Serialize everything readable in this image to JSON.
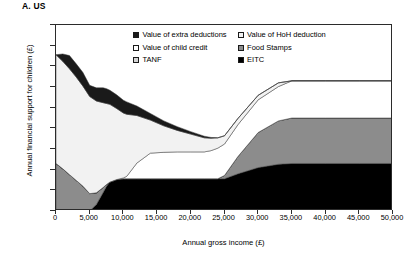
{
  "panel": {
    "title": "A. US"
  },
  "axes": {
    "xlabel": "Annual gross income (£)",
    "ylabel": "Annual financial support for children (£)",
    "yticks": [
      "0",
      "500",
      "1,000",
      "1,500",
      "2,000",
      "2,500",
      "3,000",
      "3,500",
      "4,000",
      "4,500"
    ],
    "xticks": [
      "0",
      "5,000",
      "10,000",
      "15,000",
      "20,000",
      "25,000",
      "30,000",
      "35,000",
      "40,000",
      "45,000",
      "50,000"
    ]
  },
  "legend": {
    "items": [
      {
        "label": "Value of extra deductions",
        "color": "#1a1a1a"
      },
      {
        "label": "Value of HoH deduction",
        "color": "#f2f2f2"
      },
      {
        "label": "Value of child credit",
        "color": "#ffffff"
      },
      {
        "label": "Food Stamps",
        "color": "#8c8c8c"
      },
      {
        "label": "TANF",
        "color": "#d4d4d4"
      },
      {
        "label": "EITC",
        "color": "#000000"
      }
    ]
  },
  "chart_data": {
    "type": "area",
    "title": "A. US",
    "xlabel": "Annual gross income (£)",
    "ylabel": "Annual financial support for children (£)",
    "xlim": [
      0,
      50000
    ],
    "ylim": [
      0,
      4500
    ],
    "grid": false,
    "legend_position": "top-right-inside",
    "stacking": "stacked",
    "x": [
      0,
      1000,
      2000,
      3000,
      4000,
      5000,
      6000,
      7000,
      7500,
      8000,
      9000,
      10000,
      10500,
      12000,
      14000,
      16000,
      18000,
      20000,
      22000,
      23000,
      24000,
      25000,
      27000,
      30000,
      33000,
      35000,
      40000,
      45000,
      50000
    ],
    "series": [
      {
        "name": "EITC",
        "color": "#000000",
        "values": [
          0,
          0,
          0,
          0,
          0,
          0,
          160,
          450,
          600,
          700,
          760,
          780,
          780,
          780,
          780,
          780,
          780,
          780,
          780,
          780,
          780,
          780,
          900,
          1050,
          1130,
          1150,
          1150,
          1150,
          1150
        ]
      },
      {
        "name": "Food Stamps",
        "color": "#8c8c8c",
        "values": [
          1150,
          1020,
          880,
          740,
          600,
          420,
          280,
          120,
          40,
          0,
          0,
          0,
          0,
          0,
          0,
          0,
          0,
          0,
          0,
          0,
          0,
          80,
          420,
          850,
          1050,
          1100,
          1100,
          1100,
          1100
        ]
      },
      {
        "name": "TANF",
        "color": "#d4d4d4",
        "values": [
          0,
          0,
          0,
          0,
          0,
          0,
          0,
          0,
          0,
          0,
          0,
          0,
          0,
          0,
          0,
          0,
          0,
          0,
          0,
          0,
          0,
          0,
          0,
          0,
          0,
          0,
          0,
          0,
          0
        ]
      },
      {
        "name": "Value of child credit",
        "color": "#ffffff",
        "values": [
          0,
          0,
          0,
          0,
          0,
          0,
          0,
          0,
          0,
          0,
          0,
          20,
          60,
          380,
          620,
          640,
          650,
          650,
          650,
          680,
          740,
          760,
          770,
          790,
          830,
          900,
          900,
          900,
          900
        ]
      },
      {
        "name": "Value of HoH deduction",
        "color": "#f2f2f2",
        "values": [
          2630,
          2600,
          2560,
          2500,
          2420,
          2350,
          2220,
          2050,
          1960,
          1880,
          1720,
          1570,
          1500,
          1150,
          800,
          640,
          520,
          430,
          340,
          300,
          250,
          200,
          150,
          110,
          90,
          0,
          0,
          0,
          0
        ]
      },
      {
        "name": "Value of extra deductions",
        "color": "#1a1a1a",
        "values": [
          0,
          180,
          320,
          320,
          330,
          270,
          320,
          360,
          360,
          340,
          330,
          310,
          300,
          230,
          160,
          120,
          90,
          60,
          40,
          20,
          0,
          0,
          0,
          0,
          0,
          0,
          0,
          0,
          0
        ]
      }
    ],
    "notes": [
      "Total support starts near £3,780 at zero income.",
      "Total falls to a trough of about £1,430 between £20,000 and £23,000.",
      "Total rises again, reaching a plateau of about £3,150 from £35,000 to £50,000.",
      "Black EITC band plateaus at about £1,150 from £35,000 onward.",
      "Grey Food Stamps band upper edge plateaus at about £2,250 from £35,000 onward."
    ]
  }
}
